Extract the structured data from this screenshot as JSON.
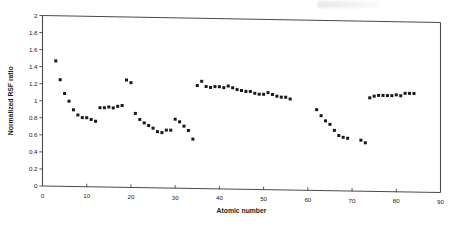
{
  "chart_data": {
    "type": "scatter",
    "title": "",
    "xlabel": "Atomic number",
    "ylabel": "Normalized RSF ratio",
    "xlim": [
      0,
      90
    ],
    "ylim": [
      0,
      2
    ],
    "xticks": [
      0,
      10,
      20,
      30,
      40,
      50,
      60,
      70,
      80,
      90
    ],
    "xtick_labels": [
      "0",
      "10",
      "20",
      "30",
      "40",
      "50",
      "60",
      "70",
      "80",
      "90"
    ],
    "yticks": [
      0,
      0.2,
      0.4,
      0.6,
      0.8,
      1,
      1.2,
      1.4,
      1.6,
      1.8,
      2
    ],
    "ytick_labels": [
      "0",
      "0.2",
      "0.4",
      "0.6",
      "0.8",
      "1",
      "1.2",
      "1.4",
      "1.6",
      "1.8",
      "2"
    ],
    "grid": false,
    "legend": false,
    "marker": "square",
    "marker_color": "#191919",
    "marker_size": 3,
    "series": [
      {
        "name": "Normalized RSF ratio",
        "x": [
          3,
          4,
          5,
          6,
          7,
          8,
          9,
          10,
          11,
          12,
          13,
          14,
          15,
          16,
          17,
          18,
          19,
          20,
          21,
          22,
          23,
          24,
          25,
          26,
          27,
          28,
          29,
          30,
          31,
          32,
          33,
          34,
          35,
          36,
          37,
          38,
          39,
          40,
          41,
          42,
          43,
          44,
          45,
          46,
          47,
          48,
          49,
          50,
          51,
          52,
          53,
          54,
          55,
          56,
          62,
          63,
          64,
          65,
          66,
          67,
          68,
          69,
          72,
          73,
          74,
          75,
          76,
          77,
          78,
          79,
          80,
          81,
          82,
          83,
          84
        ],
        "y": [
          1.47,
          1.25,
          1.09,
          1.0,
          0.9,
          0.84,
          0.81,
          0.81,
          0.79,
          0.77,
          0.93,
          0.93,
          0.94,
          0.93,
          0.95,
          0.96,
          1.26,
          1.23,
          0.87,
          0.8,
          0.76,
          0.73,
          0.7,
          0.66,
          0.65,
          0.68,
          0.68,
          0.81,
          0.78,
          0.73,
          0.68,
          0.58,
          1.21,
          1.26,
          1.2,
          1.19,
          1.2,
          1.2,
          1.19,
          1.21,
          1.19,
          1.17,
          1.16,
          1.15,
          1.15,
          1.13,
          1.12,
          1.12,
          1.14,
          1.12,
          1.1,
          1.09,
          1.09,
          1.07,
          0.95,
          0.88,
          0.82,
          0.78,
          0.71,
          0.65,
          0.63,
          0.62,
          0.6,
          0.57,
          1.1,
          1.12,
          1.13,
          1.13,
          1.13,
          1.13,
          1.14,
          1.13,
          1.16,
          1.16,
          1.16
        ]
      }
    ]
  },
  "axes": {
    "x_title": "Atomic number",
    "y_title": "Normalized RSF ratio"
  }
}
